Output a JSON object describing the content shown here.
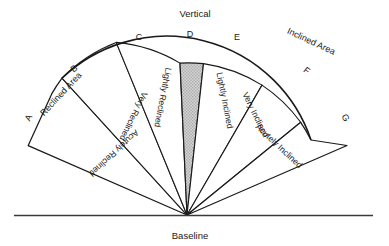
{
  "figure": {
    "title_top": "Vertical",
    "baseline_label": "Baseline",
    "area_left": "Reclined Area",
    "area_right": "Inclined Area",
    "background_color": "#ffffff",
    "line_color": "#1a1a1a",
    "highlight_color": "#c9c9c9"
  },
  "markers": [
    {
      "id": "A",
      "label": "A"
    },
    {
      "id": "B",
      "label": "B"
    },
    {
      "id": "C",
      "label": "C"
    },
    {
      "id": "D",
      "label": "D"
    },
    {
      "id": "E",
      "label": "E"
    },
    {
      "id": "F",
      "label": "F"
    },
    {
      "id": "G",
      "label": "G"
    }
  ],
  "segments": [
    {
      "id": "acutely-reclined",
      "label": "Acutely Reclined",
      "between": "A-B",
      "side": "left",
      "highlighted": false
    },
    {
      "id": "very-reclined",
      "label": "Very Reclined",
      "between": "B-C",
      "side": "left",
      "highlighted": false
    },
    {
      "id": "lightly-reclined",
      "label": "Lightly Reclined",
      "between": "C-D",
      "side": "left",
      "highlighted": false
    },
    {
      "id": "vertical-zone",
      "label": "",
      "between": "D-E",
      "side": "center",
      "highlighted": true
    },
    {
      "id": "lightly-inclined",
      "label": "Lightly Inclined",
      "between": "E-F",
      "side": "right",
      "highlighted": false
    },
    {
      "id": "very-inclined",
      "label": "Very Inclined",
      "between": "F-G",
      "side": "right",
      "highlighted": false
    },
    {
      "id": "acutely-inclined",
      "label": "Acutely Inclined",
      "between": "G-H",
      "side": "right",
      "highlighted": false
    }
  ]
}
